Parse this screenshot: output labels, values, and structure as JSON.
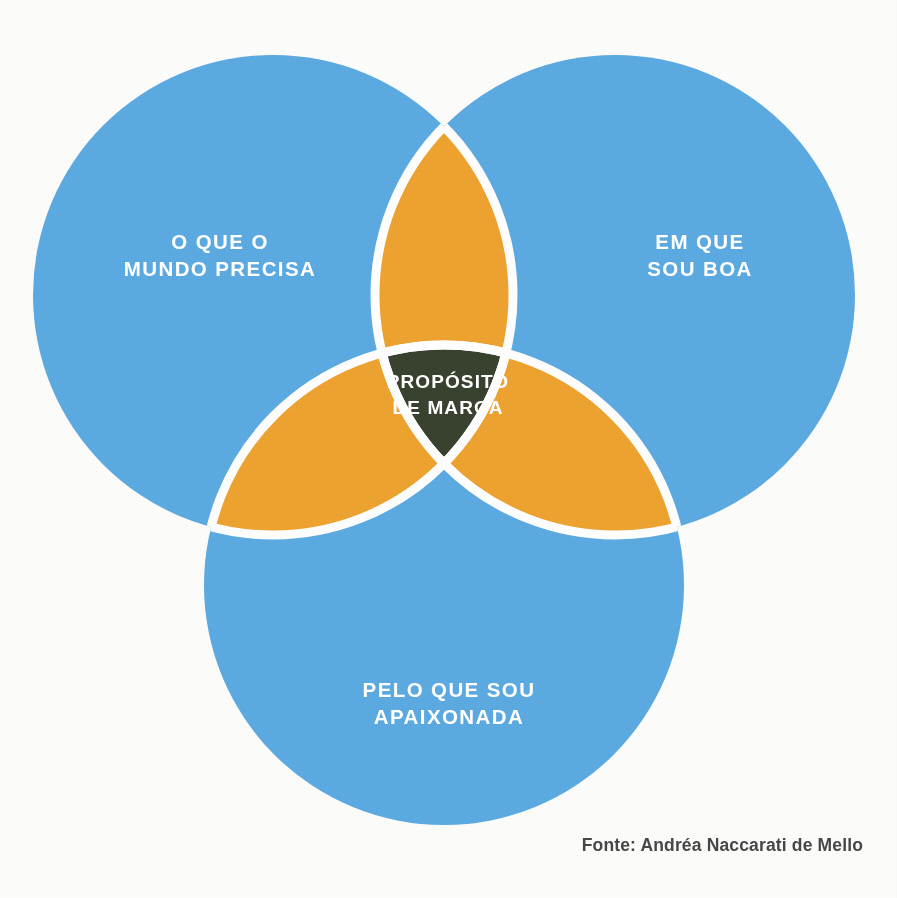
{
  "diagram": {
    "type": "venn-3-circle",
    "background_color": "#fdfdfc",
    "stroke_color": "#ffffff",
    "stroke_width_px": 8,
    "circle_color": "#5cabe3",
    "pair_overlap_color": "#efa330",
    "center_overlap_color": "#39412f",
    "label_color": "#ffffff",
    "sets": [
      {
        "id": "world",
        "label": "O QUE O\nMUNDO PRECISA",
        "position": "top-left",
        "color": "#5cabe3",
        "center": [
          273,
          295
        ],
        "radius": 240
      },
      {
        "id": "good",
        "label": "EM QUE\nSOU BOA",
        "position": "top-right",
        "color": "#5cabe3",
        "center": [
          615,
          295
        ],
        "radius": 240
      },
      {
        "id": "passion",
        "label": "PELO QUE SOU\nAPAIXONADA",
        "position": "bottom",
        "color": "#5cabe3",
        "center": [
          444,
          585
        ],
        "radius": 240
      }
    ],
    "intersections": {
      "pairwise_color": "#efa330",
      "center": {
        "label": "PROPÓSITO\nDE MARCA",
        "color": "#39412f",
        "text_color": "#ffffff"
      }
    },
    "source": {
      "text": "Fonte: Andréa Naccarati de Mello",
      "color": "#474747"
    }
  }
}
